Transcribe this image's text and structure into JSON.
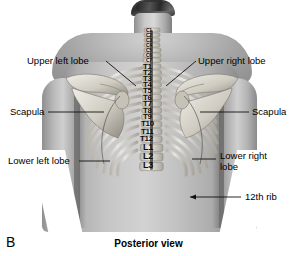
{
  "figure": {
    "panel_letter": "B",
    "caption": "Posterior view",
    "view": "Posterior view"
  },
  "callouts": [
    {
      "id": "upper-left-lobe",
      "label": "Upper left lobe",
      "side": "left"
    },
    {
      "id": "upper-right-lobe",
      "label": "Upper right lobe",
      "side": "right"
    },
    {
      "id": "scapula-left",
      "label": "Scapula",
      "side": "left"
    },
    {
      "id": "scapula-right",
      "label": "Scapula",
      "side": "right"
    },
    {
      "id": "lower-left-lobe",
      "label": "Lower left lobe",
      "side": "left"
    },
    {
      "id": "lower-right-lobe",
      "label": "Lower right lobe",
      "side": "right"
    },
    {
      "id": "twelfth-rib",
      "label": "12th rib",
      "side": "right"
    }
  ],
  "vertebrae": {
    "cervical": [
      "C1",
      "C2",
      "C3",
      "C4",
      "C5",
      "C6",
      "C7"
    ],
    "thoracic": [
      "T1",
      "T2",
      "T3",
      "T4",
      "T5",
      "T6",
      "T7",
      "T8",
      "T9",
      "T10",
      "T11",
      "T12"
    ],
    "lumbar": [
      "L1",
      "L2",
      "L3"
    ]
  },
  "colors": {
    "background": "#ffffff",
    "text": "#000000",
    "leader_line": "#1a1a1a",
    "bone": "#e8e6e0",
    "bone_shadow": "#9a968d",
    "skin_light": "#d2d2d2",
    "skin_mid": "#aeaeae",
    "skin_dark": "#808080",
    "hair": "#3a3a3a"
  }
}
